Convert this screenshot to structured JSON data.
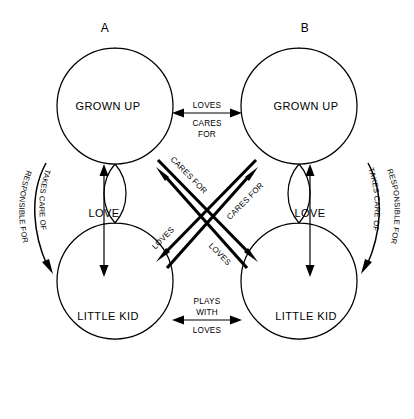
{
  "diagram": {
    "type": "relationship-diagram",
    "persons": [
      {
        "id": "A",
        "label": "A",
        "ego_states": {
          "top": "GROWN UP",
          "middle": "LOVE",
          "bottom": "LITTLE KID"
        },
        "internal_arrow": "double-headed-vertical",
        "side_curve": {
          "outer_label": "RESPONSIBLE FOR",
          "inner_label": "TAKES CARE OF",
          "direction": "downward"
        }
      },
      {
        "id": "B",
        "label": "B",
        "ego_states": {
          "top": "GROWN UP",
          "middle": "LOVE",
          "bottom": "LITTLE KID"
        },
        "internal_arrow": "double-headed-vertical",
        "side_curve": {
          "outer_label": "RESPONSIBLE FOR",
          "inner_label": "TAKES CARE OF",
          "direction": "downward"
        }
      }
    ],
    "connections": {
      "top_horizontal": {
        "from": "A.GROWN UP",
        "to": "B.GROWN UP",
        "arrow": "double-headed",
        "label_above": "LOVES",
        "label_below_line1": "CARES",
        "label_below_line2": "FOR"
      },
      "bottom_horizontal": {
        "from": "A.LITTLE KID",
        "to": "B.LITTLE KID",
        "arrow": "double-headed",
        "label_above_line1": "PLAYS",
        "label_above_line2": "WITH",
        "label_below": "LOVES"
      },
      "diagonals": [
        {
          "id": "a-grownup-to-b-littlekid",
          "from": "A.GROWN UP",
          "to": "B.LITTLE KID",
          "label": "CARES FOR"
        },
        {
          "id": "b-grownup-to-a-littlekid",
          "from": "B.GROWN UP",
          "to": "A.LITTLE KID",
          "label": "CARES FOR"
        },
        {
          "id": "a-littlekid-to-b-grownup",
          "from": "A.LITTLE KID",
          "to": "B.GROWN UP",
          "label": "LOVES"
        },
        {
          "id": "b-littlekid-to-a-grownup",
          "from": "B.LITTLE KID",
          "to": "A.GROWN UP",
          "label": "LOVES"
        }
      ]
    }
  },
  "colors": {
    "background": "#ffffff",
    "stroke": "#000000",
    "text": "#000000"
  }
}
